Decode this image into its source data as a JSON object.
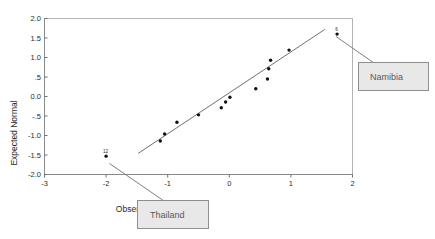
{
  "chart_data": {
    "type": "scatter",
    "title": "",
    "subtitle": "",
    "xlabel": "Observed Value",
    "ylabel": "Expected Normal",
    "xlim": [
      -3,
      2
    ],
    "ylim": [
      -2.0,
      2.0
    ],
    "xticks": [
      "-3",
      "-2",
      "-1",
      "0",
      "1",
      "2"
    ],
    "xtick_values": [
      -3,
      -2,
      -1,
      0,
      1,
      2
    ],
    "yticks": [
      "2.0",
      "1.5",
      "1.0",
      ".5",
      "0.0",
      "-.5",
      "-1.0",
      "-1.5",
      "-2.0"
    ],
    "ytick_values": [
      2.0,
      1.5,
      1.0,
      0.5,
      0.0,
      -0.5,
      -1.0,
      -1.5,
      -2.0
    ],
    "grid": false,
    "legend": "none",
    "series": [
      {
        "name": "Cases",
        "points": [
          {
            "x": -2.0,
            "y": -1.53,
            "label": "12"
          },
          {
            "x": -1.12,
            "y": -1.14,
            "label": ""
          },
          {
            "x": -1.05,
            "y": -0.96,
            "label": ""
          },
          {
            "x": -0.85,
            "y": -0.66,
            "label": ""
          },
          {
            "x": -0.5,
            "y": -0.47,
            "label": ""
          },
          {
            "x": -0.13,
            "y": -0.29,
            "label": ""
          },
          {
            "x": -0.06,
            "y": -0.14,
            "label": ""
          },
          {
            "x": 0.01,
            "y": -0.02,
            "label": ""
          },
          {
            "x": 0.43,
            "y": 0.2,
            "label": ""
          },
          {
            "x": 0.62,
            "y": 0.45,
            "label": ""
          },
          {
            "x": 0.64,
            "y": 0.71,
            "label": ""
          },
          {
            "x": 0.67,
            "y": 0.93,
            "label": ""
          },
          {
            "x": 0.97,
            "y": 1.19,
            "label": ""
          },
          {
            "x": 1.75,
            "y": 1.6,
            "label": "6"
          }
        ]
      }
    ],
    "reference_line": {
      "name": "normal-reference-line",
      "x_start": -1.48,
      "y_start": -1.46,
      "x_end": 1.55,
      "y_end": 1.72
    },
    "annotations": [
      {
        "id": "thailand",
        "text": "Thailand",
        "case_label": "12",
        "points_to": {
          "x": -2.0,
          "y": -1.53
        }
      },
      {
        "id": "namibia",
        "text": "Namibia",
        "case_label": "6",
        "points_to": {
          "x": 1.75,
          "y": 1.6
        }
      }
    ],
    "colors": {
      "point": "#111111",
      "reference_line": "#4a4a4a",
      "frame": "#b3b3b3",
      "callout_fill": "#e8e8e8",
      "callout_stroke": "#8f8f8f",
      "callout_text": "#595959",
      "background": "#ffffff"
    }
  }
}
